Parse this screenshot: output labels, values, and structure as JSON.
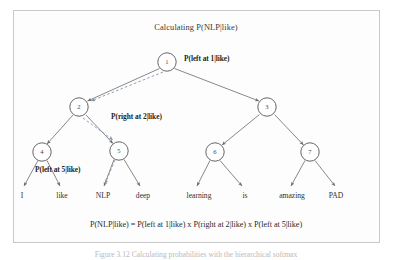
{
  "figure": {
    "title": "Calculating P(NLP|like)",
    "formula": "P(NLP|like) = P(left at 1|like) x P(right at 2|like) x P(left at 5|like)",
    "caption": "Figure 3.12 Calculating probabilities with the hierarchical softmax",
    "colors": {
      "frame_border": "#c9c9c9",
      "node_stroke": "#555555",
      "edge_stroke": "#6a6a6a",
      "highlight_dashed": "#8fa7c4",
      "text": "#303030"
    }
  },
  "tree": {
    "nodes": [
      {
        "id": "1",
        "label": "1",
        "x": 167,
        "y": 62,
        "r": 9.5
      },
      {
        "id": "2",
        "label": "2",
        "x": 79,
        "y": 107,
        "r": 9.5
      },
      {
        "id": "3",
        "label": "3",
        "x": 267,
        "y": 107,
        "r": 9.5
      },
      {
        "id": "4",
        "label": "4",
        "x": 42,
        "y": 152,
        "r": 9.5
      },
      {
        "id": "5",
        "label": "5",
        "x": 119,
        "y": 151,
        "r": 9.5
      },
      {
        "id": "6",
        "label": "6",
        "x": 215,
        "y": 152,
        "r": 9.5
      },
      {
        "id": "7",
        "label": "7",
        "x": 310,
        "y": 152,
        "r": 9.5
      }
    ],
    "leaves": [
      {
        "word": "I",
        "x": 22,
        "y": 196
      },
      {
        "word": "like",
        "x": 62,
        "y": 196
      },
      {
        "word": "NLP",
        "x": 103,
        "y": 196
      },
      {
        "word": "deep",
        "x": 143,
        "y": 196
      },
      {
        "word": "learning",
        "x": 199,
        "y": 196
      },
      {
        "word": "is",
        "x": 245,
        "y": 196
      },
      {
        "word": "amazing",
        "x": 292,
        "y": 196
      },
      {
        "word": "PAD",
        "x": 336,
        "y": 196
      }
    ],
    "probability_labels": [
      {
        "text": "P(left at 1|like)",
        "x": 184,
        "y": 55
      },
      {
        "text": "P(right at 2|like)",
        "x": 111,
        "y": 113
      },
      {
        "text": "P(left at 5|like)",
        "x": 35,
        "y": 166
      }
    ]
  },
  "layout": {
    "title_x": 196,
    "title_y": 24,
    "formula_x": 196,
    "formula_y": 225,
    "caption_x": 196,
    "caption_y": 254
  }
}
